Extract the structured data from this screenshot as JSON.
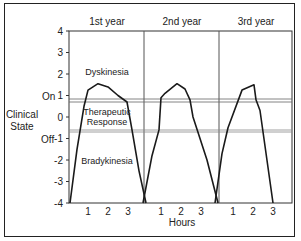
{
  "chart_data": {
    "type": "line",
    "title": "",
    "xlabel": "Hours",
    "ylabel": "Clinical State",
    "ylim": [
      -4,
      4
    ],
    "yticks": [
      4,
      3,
      2,
      1,
      0,
      -1,
      -2,
      -3,
      -4
    ],
    "y_state_labels": [
      {
        "label": "On",
        "at": 1
      },
      {
        "label": "Off",
        "at": -1
      }
    ],
    "threshold_lines": [
      {
        "name": "on-threshold",
        "value": 0.8
      },
      {
        "name": "off-threshold",
        "value": -0.65
      }
    ],
    "region_labels": [
      {
        "text": "Dyskinesia",
        "y": 2.0
      },
      {
        "text": "Therapeutic",
        "y": 0.05
      },
      {
        "text": "Response",
        "y": -0.4
      },
      {
        "text": "Bradykinesia",
        "y": -2.0
      }
    ],
    "panels": [
      {
        "label": "1st year",
        "xticks": [
          1,
          2,
          3
        ],
        "x": [
          0.1,
          0.45,
          0.8,
          1.0,
          1.5,
          2.0,
          2.5,
          2.95,
          3.2,
          3.55,
          3.9
        ],
        "y": [
          -4.0,
          -1.5,
          0.5,
          1.25,
          1.55,
          1.4,
          1.0,
          0.7,
          -0.6,
          -2.5,
          -4.0
        ]
      },
      {
        "label": "2nd year",
        "xticks": [
          1,
          2,
          3
        ],
        "x": [
          0.1,
          0.55,
          0.9,
          1.0,
          1.2,
          1.8,
          2.2,
          2.45,
          2.6,
          3.3,
          3.85
        ],
        "y": [
          -4.0,
          -1.8,
          -0.6,
          0.9,
          1.1,
          1.55,
          1.3,
          0.8,
          0.0,
          -2.0,
          -4.0
        ]
      },
      {
        "label": "3rd year",
        "xticks": [
          1,
          2,
          3
        ],
        "x": [
          0.1,
          0.45,
          0.75,
          1.45,
          2.05,
          2.15,
          2.35,
          3.0
        ],
        "y": [
          -4.0,
          -1.7,
          -0.5,
          1.25,
          1.5,
          0.8,
          0.3,
          -4.0
        ]
      }
    ]
  },
  "labels": {
    "ylabel_line1": "Clinical",
    "ylabel_line2": "State",
    "on": "On",
    "off": "Off",
    "xlabel": "Hours",
    "year1": "1st year",
    "year2": "2nd year",
    "year3": "3rd year",
    "dyskinesia": "Dyskinesia",
    "therapeutic": "Therapeutic",
    "response": "Response",
    "bradykinesia": "Bradykinesia",
    "yticks": [
      "4",
      "3",
      "2",
      "1",
      "0",
      "-1",
      "-2",
      "-3",
      "-4"
    ],
    "xticks": [
      "1",
      "2",
      "3"
    ]
  },
  "colors": {
    "line": "#1a1a1a",
    "frame": "#333333",
    "threshold": "#777777"
  }
}
